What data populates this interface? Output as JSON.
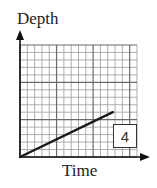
{
  "chart_data": {
    "type": "line",
    "title": "",
    "xlabel": "Time",
    "ylabel": "Depth",
    "grid": {
      "on": true,
      "columns": 16,
      "rows": 15,
      "major_every": 5
    },
    "series": [
      {
        "name": "depth",
        "x": [
          0,
          12.7
        ],
        "y": [
          0,
          6
        ],
        "color": "#1a1a1a"
      }
    ],
    "xlim": [
      0,
      16
    ],
    "ylim": [
      0,
      15
    ],
    "annotations": [
      {
        "text": "4",
        "type": "boxed-label",
        "position": "lower-right"
      }
    ]
  },
  "labels": {
    "y_axis": "Depth",
    "x_axis": "Time",
    "graph_number": "4"
  }
}
